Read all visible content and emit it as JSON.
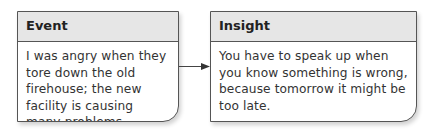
{
  "diagram": {
    "boxes": [
      {
        "title": "Event",
        "text": "I was angry when they tore down the old firehouse; the new facility is causing many problems."
      },
      {
        "title": "Insight",
        "text": "You have to speak up when you know something is wrong, because tomorrow it might be too late."
      }
    ],
    "connector": {
      "from": "Event",
      "to": "Insight",
      "type": "arrow"
    },
    "colors": {
      "header_bg": "#e6e6e6",
      "border": "#555555",
      "text": "#333333"
    }
  }
}
